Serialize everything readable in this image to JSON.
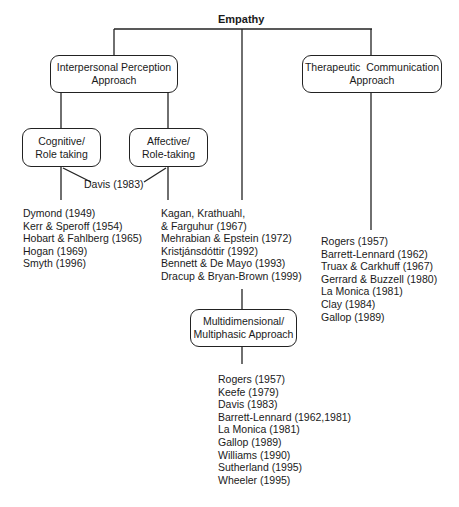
{
  "diagram": {
    "title": "Empathy",
    "approaches": {
      "interpersonal": {
        "label_line1": "Interpersonal Perception",
        "label_line2": "Approach"
      },
      "therapeutic": {
        "label_line1": "Therapeutic  Communication",
        "label_line2": "Approach"
      },
      "multidimensional": {
        "label_line1": "Multidimensional/",
        "label_line2": "Multiphasic Approach"
      }
    },
    "sub_approaches": {
      "cognitive": {
        "label_line1": "Cognitive/",
        "label_line2": "Role taking"
      },
      "affective": {
        "label_line1": "Affective/",
        "label_line2": "Role-taking"
      }
    },
    "shared_reference": "Davis (1983)",
    "lists": {
      "interpersonal_authors": [
        "Dymond (1949)",
        "Kerr & Speroff (1954)",
        "Hobart & Fahlberg (1965)",
        "Hogan (1969)",
        "Smyth (1996)"
      ],
      "center_authors": [
        "Kagan, Krathuahl,",
        "& Farguhur (1967)",
        "Mehrabian & Epstein (1972)",
        "Kristjánsdóttir (1992)",
        "Bennett & De Mayo (1993)",
        "Dracup & Bryan-Brown (1999)"
      ],
      "therapeutic_authors": [
        "Rogers (1957)",
        "Barrett-Lennard (1962)",
        "Truax & Carkhuff (1967)",
        "Gerrard & Buzzell (1980)",
        "La Monica (1981)",
        "Clay (1984)",
        "Gallop (1989)"
      ],
      "multidimensional_authors": [
        "Rogers (1957)",
        "Keefe (1979)",
        "Davis (1983)",
        "Barrett-Lennard (1962,1981)",
        "La Monica (1981)",
        "Gallop (1989)",
        "Williams (1990)",
        "Sutherland (1995)",
        "Wheeler (1995)"
      ]
    },
    "cut_off_caption": "Figure caption (cropped)"
  }
}
